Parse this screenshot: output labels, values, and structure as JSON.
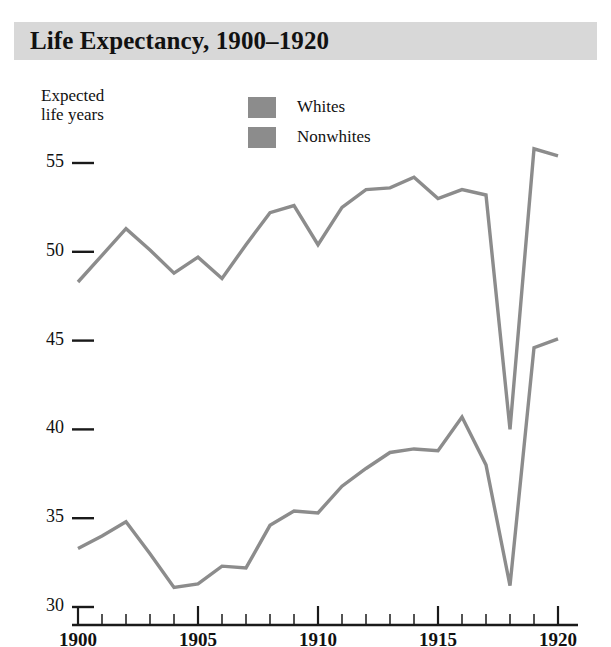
{
  "header": {
    "title": "Life Expectancy, 1900–1920"
  },
  "axis_caption": {
    "line1": "Expected",
    "line2": "life years"
  },
  "legend": {
    "items": [
      {
        "label": "Whites",
        "color": "#8c8c8c",
        "swatch_name": "legend-swatch-whites"
      },
      {
        "label": "Nonwhites",
        "color": "#8c8c8c",
        "swatch_name": "legend-swatch-nonwhites"
      }
    ]
  },
  "colors": {
    "banner": "#d8d8d8",
    "line": "#8c8c8c",
    "axis": "#1a1a1a",
    "text": "#111111"
  },
  "chart_data": {
    "type": "line",
    "title": "Life Expectancy, 1900–1920",
    "xlabel": "",
    "ylabel": "Expected life years",
    "xlim": [
      1900,
      1920
    ],
    "ylim": [
      30,
      56
    ],
    "grid": false,
    "legend_position": "top-center",
    "x_major_ticks": [
      1900,
      1905,
      1910,
      1915,
      1920
    ],
    "x_minor_ticks": [
      1901,
      1902,
      1903,
      1904,
      1906,
      1907,
      1908,
      1909,
      1911,
      1912,
      1913,
      1914,
      1916,
      1917,
      1918,
      1919
    ],
    "y_ticks": [
      30,
      35,
      40,
      45,
      50,
      55
    ],
    "x_tick_labels": [
      "1900",
      "1905",
      "1910",
      "1915",
      "1920"
    ],
    "y_tick_labels": [
      "30",
      "35",
      "40",
      "45",
      "50",
      "55"
    ],
    "x": [
      1900,
      1901,
      1902,
      1903,
      1904,
      1905,
      1906,
      1907,
      1908,
      1909,
      1910,
      1911,
      1912,
      1913,
      1914,
      1915,
      1916,
      1917,
      1918,
      1919,
      1920
    ],
    "series": [
      {
        "name": "Whites",
        "color": "#8c8c8c",
        "values": [
          48.3,
          49.8,
          51.3,
          50.1,
          48.8,
          49.7,
          48.5,
          50.4,
          52.2,
          52.6,
          50.4,
          52.5,
          53.5,
          53.6,
          54.2,
          53.0,
          53.5,
          53.2,
          40.0,
          55.8,
          55.4
        ]
      },
      {
        "name": "Nonwhites",
        "color": "#8c8c8c",
        "values": [
          33.3,
          34.0,
          34.8,
          33.0,
          31.1,
          31.3,
          32.3,
          32.2,
          34.6,
          35.4,
          35.3,
          36.8,
          37.8,
          38.7,
          38.9,
          38.8,
          40.7,
          38.0,
          31.2,
          44.6,
          45.1
        ]
      }
    ],
    "annotations": [
      {
        "text": "1918 influenza pandemic trough",
        "x": 1918,
        "visible": false
      }
    ]
  }
}
